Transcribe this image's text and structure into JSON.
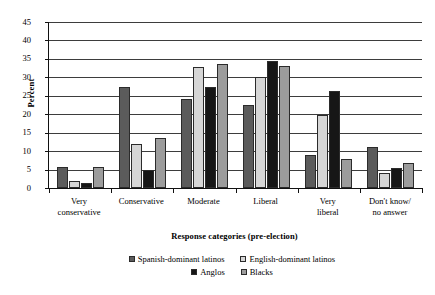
{
  "chart_data": {
    "type": "bar",
    "title": "",
    "xlabel": "Response categories (pre-election)",
    "ylabel": "Percent",
    "ylim": [
      0,
      45
    ],
    "ytick_step": 5,
    "yticks": [
      45,
      40,
      35,
      30,
      25,
      20,
      15,
      10,
      5,
      0
    ],
    "grid": true,
    "legend_position": "bottom",
    "categories": [
      "Very conservative",
      "Conservative",
      "Moderate",
      "Liberal",
      "Very liberal",
      "Don't know/ no answer"
    ],
    "category_lines": [
      [
        "Very",
        "conservative"
      ],
      [
        "Conservative",
        ""
      ],
      [
        "Moderate",
        ""
      ],
      [
        "Liberal",
        ""
      ],
      [
        "Very",
        "liberal"
      ],
      [
        "Don't know/",
        "no answer"
      ]
    ],
    "series": [
      {
        "name": "Spanish-dominant latinos",
        "color": "#5b5b5b",
        "values": [
          5.7,
          27.4,
          24.0,
          22.5,
          9.0,
          11.0
        ]
      },
      {
        "name": "English-dominant latinos",
        "color": "#d6d6d6",
        "values": [
          2.0,
          12.0,
          32.8,
          30.0,
          19.7,
          4.0
        ]
      },
      {
        "name": "Anglos",
        "color": "#161616",
        "values": [
          1.4,
          5.0,
          27.4,
          34.3,
          26.2,
          5.4
        ]
      },
      {
        "name": "Blacks",
        "color": "#9c9c9c",
        "values": [
          5.8,
          13.5,
          33.5,
          33.2,
          7.8,
          6.8
        ]
      }
    ]
  },
  "axis": {
    "y_title": "Percent",
    "x_title": "Response categories (pre-election)"
  },
  "legend": {
    "rows": [
      [
        "Spanish-dominant latinos",
        "English-dominant latinos"
      ],
      [
        "Anglos",
        "Blacks"
      ]
    ]
  }
}
